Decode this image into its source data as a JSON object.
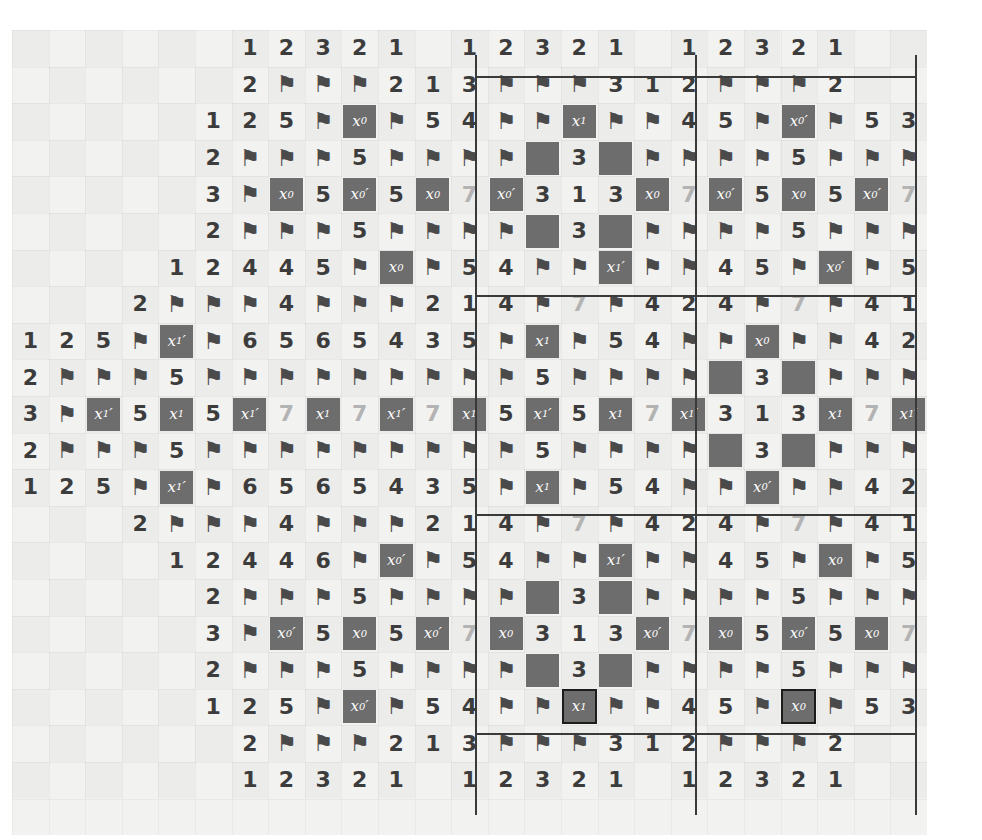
{
  "figure": {
    "type": "minesweeper-grid-diagram",
    "columns": 25,
    "rows": 22,
    "cell_size_px": 36.6,
    "colors": {
      "paper": "#f2f2f0",
      "mine_fill": "#6d6d6d",
      "mine_text": "#ffffff",
      "number_dark": "#3c3c3c",
      "number_dim": "#b3b3b3",
      "flag": "#4a4a4a",
      "rule": "#3a3a3a"
    },
    "glyphs": {
      "flag": "flag-icon",
      "empty": "",
      "mine_blank": "solid-dark-square"
    },
    "separators": {
      "vertical_x": [
        475,
        695,
        915
      ],
      "horizontal_y": [
        76,
        295,
        514,
        733
      ]
    }
  },
  "legend": {
    "variables": [
      "x_0",
      "x_0'",
      "x_1",
      "x_1'"
    ],
    "note": "x with prime denotes negated literal"
  },
  "rows": [
    [
      "",
      "",
      "",
      "",
      "",
      "",
      "1",
      "2",
      "3",
      "2",
      "1",
      "",
      "1",
      "2",
      "3",
      "2",
      "1",
      "",
      "1",
      "2",
      "3",
      "2",
      "1",
      "",
      ""
    ],
    [
      "",
      "",
      "",
      "",
      "",
      "",
      "2",
      "F",
      "F",
      "F",
      "2",
      "1",
      "3",
      "F",
      "F",
      "F",
      "3",
      "1",
      "2",
      "F",
      "F",
      "F",
      "2",
      "",
      ""
    ],
    [
      "",
      "",
      "",
      "",
      "",
      "1",
      "2",
      "5",
      "F",
      "m:x_0",
      "F",
      "5",
      "4",
      "F",
      "F",
      "m:x_1",
      "F",
      "F",
      "4",
      "5",
      "F",
      "m:x_0'",
      "F",
      "5",
      "3",
      "2"
    ],
    [
      "",
      "",
      "",
      "",
      "",
      "2",
      "F",
      "F",
      "F",
      "5",
      "F",
      "F",
      "F",
      "F",
      "m:",
      "3",
      "m:",
      "F",
      "F",
      "F",
      "F",
      "5",
      "F",
      "F",
      "F",
      "F"
    ],
    [
      "",
      "",
      "",
      "",
      "",
      "3",
      "F",
      "m:x_0",
      "5",
      "m:x_0'",
      "5",
      "m:x_0",
      "7d",
      "m:x_0'",
      "3",
      "1",
      "3",
      "m:x_0",
      "7d",
      "m:x_0'",
      "5",
      "m:x_0",
      "5",
      "m:x_0'",
      "7d",
      "m:x_0"
    ],
    [
      "",
      "",
      "",
      "",
      "",
      "2",
      "F",
      "F",
      "F",
      "5",
      "F",
      "F",
      "F",
      "F",
      "m:",
      "3",
      "m:",
      "F",
      "F",
      "F",
      "F",
      "5",
      "F",
      "F",
      "F",
      "F"
    ],
    [
      "",
      "",
      "",
      "",
      "1",
      "2",
      "4",
      "4",
      "5",
      "F",
      "m:x_0",
      "F",
      "5",
      "4",
      "F",
      "F",
      "m:x_1'",
      "F",
      "F",
      "4",
      "5",
      "F",
      "m:x_0'",
      "F",
      "5",
      "3",
      "2"
    ],
    [
      "",
      "",
      "",
      "2",
      "F",
      "F",
      "F",
      "4",
      "F",
      "F",
      "F",
      "2",
      "1",
      "4",
      "F",
      "7d",
      "F",
      "4",
      "2",
      "4",
      "F",
      "7d",
      "F",
      "4",
      "1"
    ],
    [
      "1",
      "2",
      "5",
      "F",
      "m:x_1'",
      "F",
      "6",
      "5",
      "6",
      "5",
      "4",
      "3",
      "5",
      "F",
      "m:x_1",
      "F",
      "5",
      "4",
      "F",
      "F",
      "m:x_0",
      "F",
      "F",
      "4",
      "2"
    ],
    [
      "2",
      "F",
      "F",
      "F",
      "5",
      "F",
      "F",
      "F",
      "F",
      "F",
      "F",
      "F",
      "F",
      "F",
      "5",
      "F",
      "F",
      "F",
      "F",
      "m:",
      "3",
      "m:",
      "F",
      "F",
      "F"
    ],
    [
      "3",
      "F",
      "m:x_1'",
      "5",
      "m:x_1",
      "5",
      "m:x_1'",
      "7d",
      "m:x_1",
      "7d",
      "m:x_1'",
      "7d",
      "m:x_1",
      "5",
      "m:x_1'",
      "5",
      "m:x_1",
      "7d",
      "m:x_1'",
      "3",
      "1",
      "3",
      "m:x_1",
      "7d",
      "m:x_1'"
    ],
    [
      "2",
      "F",
      "F",
      "F",
      "5",
      "F",
      "F",
      "F",
      "F",
      "F",
      "F",
      "F",
      "F",
      "F",
      "5",
      "F",
      "F",
      "F",
      "F",
      "m:",
      "3",
      "m:",
      "F",
      "F",
      "F"
    ],
    [
      "1",
      "2",
      "5",
      "F",
      "m:x_1'",
      "F",
      "6",
      "5",
      "6",
      "5",
      "4",
      "3",
      "5",
      "F",
      "m:x_1",
      "F",
      "5",
      "4",
      "F",
      "F",
      "m:x_0'",
      "F",
      "F",
      "4",
      "2"
    ],
    [
      "",
      "",
      "",
      "2",
      "F",
      "F",
      "F",
      "4",
      "F",
      "F",
      "F",
      "2",
      "1",
      "4",
      "F",
      "7d",
      "F",
      "4",
      "2",
      "4",
      "F",
      "7d",
      "F",
      "4",
      "1"
    ],
    [
      "",
      "",
      "",
      "",
      "1",
      "2",
      "4",
      "4",
      "6",
      "F",
      "m:x_0'",
      "F",
      "5",
      "4",
      "F",
      "F",
      "m:x_1'",
      "F",
      "F",
      "4",
      "5",
      "F",
      "m:x_0",
      "F",
      "5",
      "3",
      "2"
    ],
    [
      "",
      "",
      "",
      "",
      "",
      "2",
      "F",
      "F",
      "F",
      "5",
      "F",
      "F",
      "F",
      "F",
      "m:",
      "3",
      "m:",
      "F",
      "F",
      "F",
      "F",
      "5",
      "F",
      "F",
      "F",
      "F"
    ],
    [
      "",
      "",
      "",
      "",
      "",
      "3",
      "F",
      "m:x_0'",
      "5",
      "m:x_0",
      "5",
      "m:x_0'",
      "7d",
      "m:x_0",
      "3",
      "1",
      "3",
      "m:x_0'",
      "7d",
      "m:x_0",
      "5",
      "m:x_0'",
      "5",
      "m:x_0",
      "7d",
      "m:x_0'"
    ],
    [
      "",
      "",
      "",
      "",
      "",
      "2",
      "F",
      "F",
      "F",
      "5",
      "F",
      "F",
      "F",
      "F",
      "m:",
      "3",
      "m:",
      "F",
      "F",
      "F",
      "F",
      "5",
      "F",
      "F",
      "F",
      "F"
    ],
    [
      "",
      "",
      "",
      "",
      "",
      "1",
      "2",
      "5",
      "F",
      "m:x_0'",
      "F",
      "5",
      "4",
      "F",
      "F",
      "mo:x_1",
      "F",
      "F",
      "4",
      "5",
      "F",
      "mo:x_0",
      "F",
      "5",
      "3",
      "2"
    ],
    [
      "",
      "",
      "",
      "",
      "",
      "",
      "2",
      "F",
      "F",
      "F",
      "2",
      "1",
      "3",
      "F",
      "F",
      "F",
      "3",
      "1",
      "2",
      "F",
      "F",
      "F",
      "2",
      "",
      ""
    ],
    [
      "",
      "",
      "",
      "",
      "",
      "",
      "1",
      "2",
      "3",
      "2",
      "1",
      "",
      "1",
      "2",
      "3",
      "2",
      "1",
      "",
      "1",
      "2",
      "3",
      "2",
      "1",
      "",
      ""
    ]
  ]
}
